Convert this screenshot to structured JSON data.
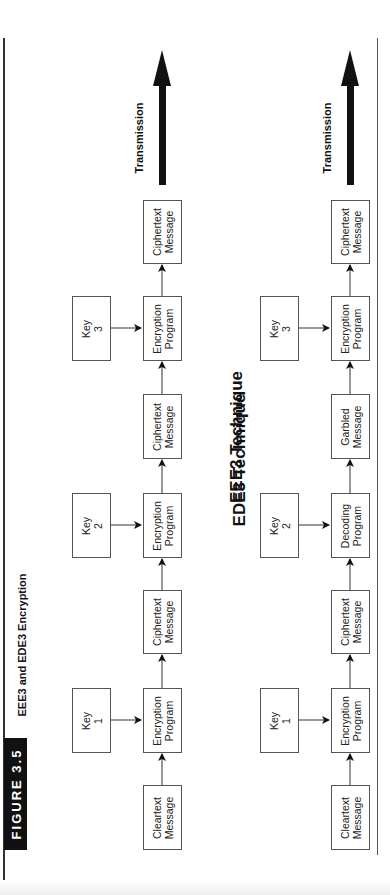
{
  "figure": {
    "label": "FIGURE 3.5",
    "title": "EEE3 and EDE3 Encryption"
  },
  "eee3": {
    "heading": "EEE3 Technique",
    "chain": [
      {
        "line1": "Cleartext",
        "line2": "Message"
      },
      {
        "line1": "Encryption",
        "line2": "Program"
      },
      {
        "line1": "Ciphertext",
        "line2": "Message"
      },
      {
        "line1": "Encryption",
        "line2": "Program"
      },
      {
        "line1": "Ciphertext",
        "line2": "Message"
      },
      {
        "line1": "Encryption",
        "line2": "Program"
      },
      {
        "line1": "Ciphertext",
        "line2": "Message"
      }
    ],
    "keys": [
      {
        "line1": "Key",
        "line2": "1"
      },
      {
        "line1": "Key",
        "line2": "2"
      },
      {
        "line1": "Key",
        "line2": "3"
      }
    ],
    "transmission": "Transmission"
  },
  "ede3": {
    "heading": "EDE3 Technique",
    "chain": [
      {
        "line1": "Cleartext",
        "line2": "Message"
      },
      {
        "line1": "Encryption",
        "line2": "Program"
      },
      {
        "line1": "Ciphertext",
        "line2": "Message"
      },
      {
        "line1": "Decoding",
        "line2": "Program"
      },
      {
        "line1": "Garbled",
        "line2": "Message"
      },
      {
        "line1": "Encryption",
        "line2": "Program"
      },
      {
        "line1": "Ciphertext",
        "line2": "Message"
      }
    ],
    "keys": [
      {
        "line1": "Key",
        "line2": "1"
      },
      {
        "line1": "Key",
        "line2": "2"
      },
      {
        "line1": "Key",
        "line2": "3"
      }
    ],
    "transmission": "Transmission"
  },
  "colors": {
    "ink": "#111111",
    "box_border": "#555555",
    "background": "#ffffff"
  }
}
